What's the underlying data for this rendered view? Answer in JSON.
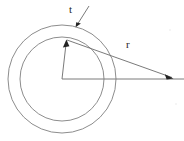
{
  "figure": {
    "type": "annulus-cross-section-diagram",
    "background_color": "#ffffff",
    "line_color": "#8d8d8d",
    "annotation_color": "#232323",
    "labels": {
      "thickness": "t",
      "radius": "r"
    },
    "geometry": {
      "center_x": 62,
      "center_y": 79,
      "outer_radius": 54,
      "inner_radius": 42,
      "thickness_label_x": 69,
      "thickness_label_y": 13,
      "radius_label_x": 126,
      "radius_label_y": 48,
      "axis_line_start_x": 62,
      "axis_line_end_x": 184,
      "axis_line_y": 79,
      "radius_arrow_start_x": 67,
      "radius_arrow_start_y": 40,
      "radius_arrow_end_x": 173,
      "radius_arrow_end_y": 78,
      "center_arrow_start_x": 62,
      "center_arrow_start_y": 79,
      "center_arrow_end_x": 66,
      "center_arrow_end_y": 40,
      "leader_start_x": 89,
      "leader_start_y": 7,
      "leader_end_x": 76,
      "leader_end_y": 27
    }
  }
}
